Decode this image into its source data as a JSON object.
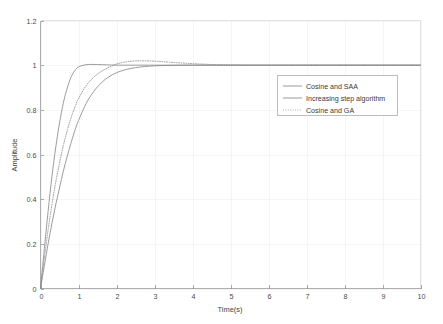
{
  "chart_data": {
    "type": "line",
    "title": "",
    "xlabel": "Time(s)",
    "ylabel": "Amplitude",
    "xlim": [
      0,
      10
    ],
    "ylim": [
      0,
      1.2
    ],
    "xticks": [
      "0",
      "1",
      "2",
      "3",
      "4",
      "5",
      "6",
      "7",
      "8",
      "9",
      "10"
    ],
    "yticks": [
      "0",
      "0.2",
      "0.4",
      "0.6",
      "0.8",
      "1",
      "1.2"
    ],
    "grid": true,
    "legend_position": "upper-right",
    "series": [
      {
        "name": "Cosine and SAA",
        "style": "solid",
        "color": "#8a8a8a",
        "x": [
          0,
          0.1,
          0.2,
          0.3,
          0.4,
          0.5,
          0.6,
          0.7,
          0.8,
          0.9,
          1.0,
          1.2,
          1.5,
          2.0,
          2.5,
          3.0,
          4.0,
          5.0,
          6.0,
          7.0,
          8.0,
          9.0,
          10.0
        ],
        "values": [
          0,
          0.175,
          0.345,
          0.5,
          0.63,
          0.74,
          0.83,
          0.895,
          0.945,
          0.975,
          0.992,
          1.002,
          1.003,
          1.0,
          1.0,
          1.0,
          1.0,
          1.0,
          1.0,
          1.0,
          1.0,
          1.0,
          1.0
        ]
      },
      {
        "name": "Increasing step algorithm",
        "style": "solid",
        "color": "#8a8a8a",
        "x": [
          0,
          0.1,
          0.2,
          0.3,
          0.4,
          0.5,
          0.6,
          0.7,
          0.8,
          0.9,
          1.0,
          1.2,
          1.4,
          1.6,
          1.8,
          2.0,
          2.2,
          2.5,
          3.0,
          3.5,
          4.0,
          5.0,
          6.0,
          7.0,
          8.0,
          9.0,
          10.0
        ],
        "values": [
          0,
          0.1,
          0.2,
          0.29,
          0.375,
          0.45,
          0.525,
          0.59,
          0.65,
          0.705,
          0.752,
          0.828,
          0.882,
          0.921,
          0.948,
          0.966,
          0.978,
          0.989,
          0.997,
          0.999,
          1.0,
          1.0,
          1.0,
          1.0,
          1.0,
          1.0,
          1.0
        ]
      },
      {
        "name": "Cosine and GA",
        "style": "dotted",
        "color": "#8a8a8a",
        "x": [
          0,
          0.1,
          0.2,
          0.3,
          0.4,
          0.5,
          0.6,
          0.7,
          0.8,
          0.9,
          1.0,
          1.2,
          1.4,
          1.6,
          1.8,
          2.0,
          2.2,
          2.5,
          3.0,
          3.5,
          4.0,
          4.5,
          5.0,
          6.0,
          7.0,
          8.0,
          9.0,
          10.0
        ],
        "values": [
          0,
          0.135,
          0.262,
          0.375,
          0.475,
          0.562,
          0.64,
          0.705,
          0.762,
          0.81,
          0.85,
          0.908,
          0.946,
          0.972,
          0.99,
          1.005,
          1.013,
          1.019,
          1.018,
          1.012,
          1.007,
          1.003,
          1.001,
          1.0,
          1.0,
          1.0,
          1.0,
          1.0
        ]
      }
    ],
    "legend": [
      {
        "label": "Cosine and SAA",
        "style": "solid"
      },
      {
        "label": "Increasing step algorithm",
        "style": "solid"
      },
      {
        "label": "Cosine and GA",
        "style": "dotted"
      }
    ]
  }
}
